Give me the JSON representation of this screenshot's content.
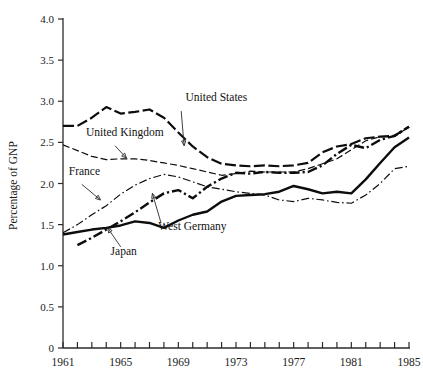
{
  "chart_data": {
    "type": "line",
    "title": "",
    "xlabel": "",
    "ylabel": "Percentage of GNP",
    "xlim": [
      1961,
      1985
    ],
    "ylim": [
      0,
      4.0
    ],
    "grid": false,
    "legend_position": "inline-annotations",
    "x_ticks": [
      1961,
      1962,
      1963,
      1964,
      1965,
      1966,
      1967,
      1968,
      1969,
      1970,
      1971,
      1972,
      1973,
      1974,
      1975,
      1976,
      1977,
      1978,
      1979,
      1980,
      1981,
      1982,
      1983,
      1984,
      1985
    ],
    "x_tick_labels": [
      "1961",
      "",
      "",
      "",
      "1965",
      "",
      "",
      "",
      "1969",
      "",
      "",
      "",
      "1973",
      "",
      "",
      "",
      "1977",
      "",
      "",
      "",
      "1981",
      "",
      "",
      "",
      "1985"
    ],
    "y_ticks": [
      0,
      0.5,
      1.0,
      1.5,
      2.0,
      2.5,
      3.0,
      3.5,
      4.0
    ],
    "y_tick_labels": [
      "0",
      "0.5",
      "1.0",
      "1.5",
      "2.0",
      "2.5",
      "3.0",
      "3.5",
      "4.0"
    ],
    "x": [
      1961,
      1962,
      1963,
      1964,
      1965,
      1966,
      1967,
      1968,
      1969,
      1970,
      1971,
      1972,
      1973,
      1974,
      1975,
      1976,
      1977,
      1978,
      1979,
      1980,
      1981,
      1982,
      1983,
      1984,
      1985
    ],
    "series": [
      {
        "name": "United States",
        "style": "long-dash",
        "width": 2.2,
        "values": [
          2.7,
          2.7,
          2.8,
          2.93,
          2.85,
          2.87,
          2.9,
          2.8,
          2.62,
          2.45,
          2.32,
          2.24,
          2.22,
          2.21,
          2.22,
          2.21,
          2.22,
          2.25,
          2.38,
          2.45,
          2.48,
          2.55,
          2.57,
          2.58,
          2.69
        ]
      },
      {
        "name": "United Kingdom",
        "style": "thin-dash",
        "width": 1.2,
        "values": [
          2.47,
          2.4,
          2.33,
          2.29,
          2.3,
          2.3,
          2.28,
          2.25,
          2.22,
          2.18,
          2.14,
          2.1,
          2.12,
          2.15,
          2.14,
          2.14,
          2.14,
          2.18,
          2.24,
          2.3,
          2.41,
          2.52,
          2.57,
          2.57,
          2.69
        ]
      },
      {
        "name": "France",
        "style": "thin-dash-dot",
        "width": 1.2,
        "values": [
          1.4,
          1.5,
          1.62,
          1.73,
          1.87,
          1.98,
          2.06,
          2.11,
          2.08,
          2.02,
          1.96,
          1.93,
          1.9,
          1.88,
          1.86,
          1.8,
          1.78,
          1.82,
          1.8,
          1.77,
          1.76,
          1.86,
          2.0,
          2.18,
          2.21
        ]
      },
      {
        "name": "West Germany",
        "style": "solid",
        "width": 2.4,
        "values": [
          1.38,
          1.41,
          1.44,
          1.46,
          1.49,
          1.54,
          1.52,
          1.46,
          1.55,
          1.62,
          1.66,
          1.78,
          1.85,
          1.86,
          1.87,
          1.9,
          1.97,
          1.93,
          1.88,
          1.9,
          1.88,
          2.05,
          2.25,
          2.44,
          2.56
        ]
      },
      {
        "name": "Japan",
        "style": "dash-dot",
        "width": 2.4,
        "values": [
          null,
          1.25,
          1.34,
          1.44,
          1.54,
          1.65,
          1.77,
          1.88,
          1.92,
          1.82,
          1.96,
          2.06,
          2.13,
          2.12,
          2.14,
          2.13,
          2.13,
          2.14,
          2.22,
          2.36,
          2.47,
          2.43,
          2.53,
          2.58,
          2.69
        ]
      }
    ],
    "annotations": [
      {
        "label": "United States",
        "x": 1969.5,
        "y": 3.0
      },
      {
        "label": "United Kingdom",
        "x": 1962.6,
        "y": 2.58
      },
      {
        "label": "France",
        "x": 1961.4,
        "y": 2.1
      },
      {
        "label": "West Germany",
        "x": 1967.6,
        "y": 1.43
      },
      {
        "label": "Japan",
        "x": 1964.3,
        "y": 1.13
      }
    ]
  },
  "colors": {
    "ink": "#0d0d0d",
    "axis": "#2b2b2b",
    "background": "#ffffff"
  }
}
